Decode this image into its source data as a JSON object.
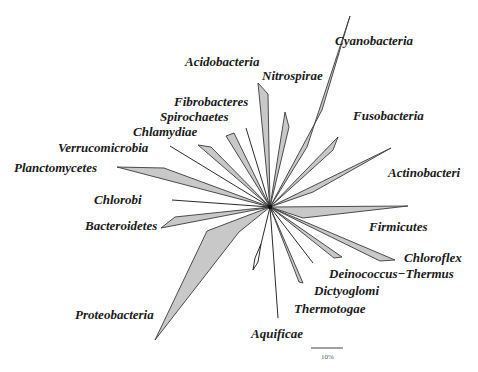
{
  "figure": {
    "type": "unrooted phylogenetic tree",
    "hub": {
      "x": 270,
      "y": 207
    },
    "clade_fill": "#c8c8c8",
    "line_color": "#2a2a2a"
  },
  "labels": {
    "cyanobacteria": "Cyanobacteria",
    "acidobacteria": "Acidobacteria",
    "nitrospirae": "Nitrospirae",
    "fibrobacteres": "Fibrobacteres",
    "spirochaetes": "Spirochaetes",
    "chlamydiae": "Chlamydiae",
    "verrucomicrobia": "Verrucomicrobia",
    "planctomycetes": "Planctomycetes",
    "fusobacteria": "Fusobacteria",
    "actinobacteria": "Actinobacteri",
    "chlorobi": "Chlorobi",
    "bacteroidetes": "Bacteroidetes",
    "firmicutes": "Firmicutes",
    "chloroflexi": "Chloroflex",
    "deinococcus_thermus": "Deinococcus−Thermus",
    "dictyoglomi": "Dictyoglomi",
    "thermotogae": "Thermotogae",
    "proteobacteria": "Proteobacteria",
    "aquificae": "Aquificae"
  },
  "scale_bar": {
    "label": "10%",
    "x1": 311,
    "x2": 343,
    "y": 348
  },
  "clades": [
    {
      "name": "Cyanobacteria",
      "points": "270,207 307,147 350,16 322,110"
    },
    {
      "name": "Nitrospirae",
      "points": "270,207 258,83 268,94"
    },
    {
      "name": "Unnamed-upper",
      "points": "270,207 285,112 289,127"
    },
    {
      "name": "Fusobacteria",
      "points": "270,207 338,137 333,150"
    },
    {
      "name": "Actinobacteria",
      "points": "270,207 391,148 313,192"
    },
    {
      "name": "Firmicutes",
      "points": "270,207 408,206 303,218"
    },
    {
      "name": "Chloroflexi",
      "points": "270,207 395,260 380,261"
    },
    {
      "name": "Deinococcus-Thermus",
      "points": "270,207 342,257 334,258"
    },
    {
      "name": "Dictyoglomi",
      "points": "270,207 303,283 299,282"
    },
    {
      "name": "Proteobacteria",
      "points": "270,207 239,232 155,340 207,231"
    },
    {
      "name": "Bacteroidetes",
      "points": "270,207 175,217 161,228"
    },
    {
      "name": "Planctomycetes",
      "points": "270,207 164,168 117,167"
    },
    {
      "name": "Chlamydiae",
      "points": "270,207 211,147 198,145"
    },
    {
      "name": "Spirochaetes",
      "points": "270,207 234,133 226,136"
    }
  ],
  "branches": [
    {
      "name": "Verrucomicrobia",
      "points": "270,207 170,146"
    },
    {
      "name": "Fibrobacteres",
      "points": "270,207 246,128"
    },
    {
      "name": "Chlorobi",
      "points": "270,207 172,200"
    },
    {
      "name": "Unnamed-right",
      "points": "270,207 313,263"
    },
    {
      "name": "Thermotogae",
      "points": "270,207 278,318"
    },
    {
      "name": "Aquificae-stem",
      "points": "270,207 261,244"
    }
  ],
  "diamond": {
    "name": "Aquificae-node",
    "points": "262,243 256,262 251,273 260,266 262,243"
  }
}
